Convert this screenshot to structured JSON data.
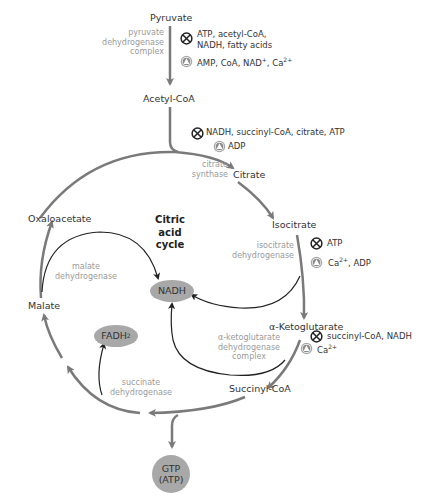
{
  "diagram": {
    "title": "Citric acid cycle",
    "title_lines": [
      "Citric",
      "acid",
      "cycle"
    ],
    "colors": {
      "main_arrow": "#7a7a7a",
      "cofactor_arrow": "#222222",
      "enzyme_text": "#9a9a9a",
      "product_pill": "#a8a8a8"
    },
    "metabolites": {
      "pyruvate": "Pyruvate",
      "acetyl_coa": "Acetyl-CoA",
      "citrate": "Citrate",
      "isocitrate": "Isocitrate",
      "alpha_ketoglutarate": "α-Ketoglutarate",
      "succinyl_coa": "Succinyl-CoA",
      "malate": "Malate",
      "oxaloacetate": "Oxaloacetate"
    },
    "products": {
      "nadh": "NADH",
      "fadh2": "FADH",
      "fadh2_sub": "2",
      "gtp_line1": "GTP",
      "gtp_line2": "(ATP)"
    },
    "enzymes": {
      "pdh": [
        "pyruvate",
        "dehydrogenase",
        "complex"
      ],
      "citrate_synthase": [
        "citrate",
        "synthase"
      ],
      "isocitrate_dh": [
        "isocitrate",
        "dehydrogenase"
      ],
      "akg_dh": [
        "α-ketoglutarate",
        "dehydrogenase",
        "complex"
      ],
      "succinate_dh": [
        "succinate",
        "dehydrogenase"
      ],
      "malate_dh": [
        "malate",
        "dehydrogenase"
      ]
    },
    "regulation": {
      "pdh": {
        "inhibitors": [
          "ATP, acetyl-CoA,",
          "NADH, fatty acids"
        ],
        "activators": "AMP, CoA, NAD",
        "activators_sup": "+",
        "activators_tail": ", Ca",
        "activators_tail_sup": "2+"
      },
      "citrate_synthase": {
        "inhibitors": "NADH, succinyl-CoA, citrate, ATP",
        "activators": "ADP"
      },
      "isocitrate_dh": {
        "inhibitors": "ATP",
        "activators_pre": "Ca",
        "activators_sup": "2+",
        "activators_tail": ", ADP"
      },
      "akg_dh": {
        "inhibitors": "succinyl-CoA, NADH",
        "activators_pre": "Ca",
        "activators_sup": "2+"
      }
    },
    "legend_icons": {
      "inhibitor": "circled-x-inhibitor-icon",
      "activator": "circled-triangle-activator-icon"
    }
  }
}
